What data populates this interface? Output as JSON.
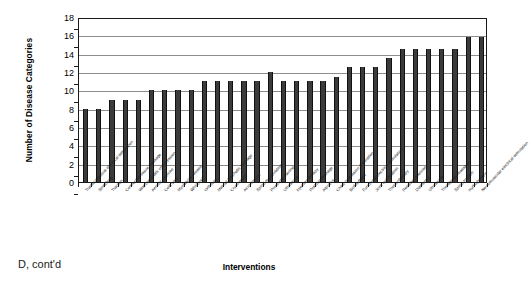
{
  "figure": {
    "caption": "D, cont'd"
  },
  "chart_data": {
    "type": "bar",
    "title": "",
    "xlabel": "Interventions",
    "ylabel": "Number of Disease Categories",
    "ylim": [
      0,
      18
    ],
    "ytick_labels": [
      "0",
      "2",
      "4",
      "6",
      "8",
      "10",
      "12",
      "14",
      "16",
      "18"
    ],
    "ytick_values": [
      0,
      2,
      4,
      6,
      8,
      10,
      12,
      14,
      16,
      18
    ],
    "grid": true,
    "legend": "none",
    "bar_color": "#3b3b3b",
    "categories": [
      "Transcutaneous electrical stimulation",
      "Stretching",
      "Traction",
      "Connective tissue massage",
      "Vasopneumatic compression",
      "Aerobic exercise",
      "Cold laser",
      "Myofascial release",
      "Whirlpool",
      "Orthoses",
      "Manual lymphatic drainage",
      "Cryotherapy",
      "Acupuncture",
      "Spinal manipulation",
      "Prosthetic training",
      "Ultrasound",
      "Injection therapy",
      "Postural drainage",
      "Aquatics",
      "Chest percussion & vibration",
      "Biofeedback",
      "Functional electrical stimulation",
      "Joint mobilization",
      "Thermotherapy",
      "Resistive exercise",
      "Diathermy",
      "Ultrasound",
      "Therapeutic massage",
      "Spinal traction",
      "Hydrotherapy",
      "Neuromuscular electrical stimulation"
    ],
    "values": [
      8,
      8,
      9,
      9,
      9,
      10,
      10,
      10,
      10,
      11,
      11,
      11,
      11,
      11,
      12,
      11,
      11,
      11,
      11,
      11.5,
      12.5,
      12.5,
      12.5,
      13.5,
      14.5,
      14.5,
      14.5,
      14.5,
      14.5,
      15.8,
      15.8
    ]
  }
}
